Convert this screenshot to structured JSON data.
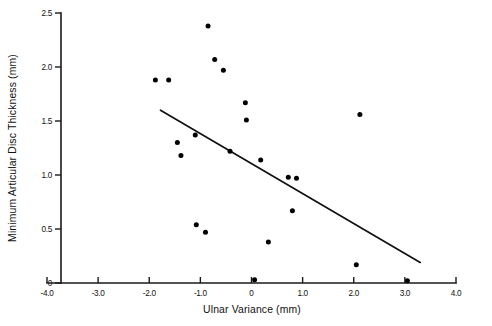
{
  "chart_data": {
    "type": "scatter",
    "title": "",
    "xlabel": "Ulnar Variance  (mm)",
    "ylabel": "Minimum Articular Disc Thickness (mm)",
    "xlim": [
      -4.0,
      4.0
    ],
    "ylim": [
      0,
      2.5
    ],
    "grid": false,
    "legend": null,
    "xticks": [
      "-4.0",
      "-3.0",
      "-2.0",
      "-1.0",
      "0",
      "1.0",
      "2.0",
      "3.0",
      "4.0"
    ],
    "xtick_values": [
      -4.0,
      -3.0,
      -2.0,
      -1.0,
      0,
      1.0,
      2.0,
      3.0,
      4.0
    ],
    "yticks": [
      "0",
      "0.5",
      "1.0",
      "1.5",
      "2.0",
      "2.5"
    ],
    "ytick_values": [
      0,
      0.5,
      1.0,
      1.5,
      2.0,
      2.5
    ],
    "points": [
      {
        "x": -1.88,
        "y": 1.88
      },
      {
        "x": -1.62,
        "y": 1.88
      },
      {
        "x": -1.45,
        "y": 1.3
      },
      {
        "x": -1.38,
        "y": 1.18
      },
      {
        "x": -1.1,
        "y": 1.37
      },
      {
        "x": -1.08,
        "y": 0.54
      },
      {
        "x": -0.9,
        "y": 0.47
      },
      {
        "x": -0.85,
        "y": 2.38
      },
      {
        "x": -0.72,
        "y": 2.07
      },
      {
        "x": -0.55,
        "y": 1.97
      },
      {
        "x": -0.42,
        "y": 1.22
      },
      {
        "x": -0.12,
        "y": 1.67
      },
      {
        "x": -0.1,
        "y": 1.51
      },
      {
        "x": 0.06,
        "y": 0.03
      },
      {
        "x": 0.18,
        "y": 1.14
      },
      {
        "x": 0.33,
        "y": 0.38
      },
      {
        "x": 0.72,
        "y": 0.98
      },
      {
        "x": 0.88,
        "y": 0.97
      },
      {
        "x": 0.8,
        "y": 0.67
      },
      {
        "x": 2.05,
        "y": 0.17
      },
      {
        "x": 2.12,
        "y": 1.56
      },
      {
        "x": 3.05,
        "y": 0.02
      }
    ],
    "fit_line": {
      "x_start": -1.78,
      "y_start": 1.6,
      "x_end": 3.3,
      "y_end": 0.19
    }
  },
  "colors": {
    "point": "#000000",
    "axis": "#1a1a1a",
    "line": "#111111",
    "background": "#ffffff"
  }
}
